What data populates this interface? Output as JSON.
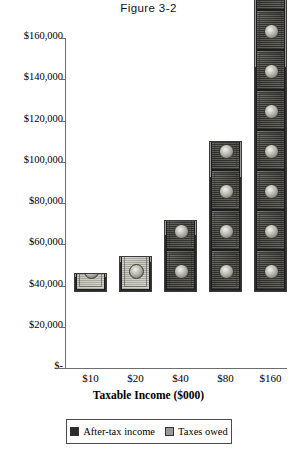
{
  "figure": {
    "title": "Figure 3-2"
  },
  "chart_data": {
    "type": "bar",
    "title": "Figure 3-2",
    "xlabel": "Taxable Income ($000)",
    "ylabel": "",
    "categories": [
      "$10",
      "$20",
      "$40",
      "$80",
      "$160"
    ],
    "ylim": [
      0,
      160000
    ],
    "ytick_labels": [
      "$160,000",
      "$140,000",
      "$120,000",
      "$100,000",
      "$80,000",
      "$60,000",
      "$40,000",
      "$20,000",
      "$-"
    ],
    "ytick_values": [
      160000,
      140000,
      120000,
      100000,
      80000,
      60000,
      40000,
      20000,
      0
    ],
    "grid": false,
    "stacked": true,
    "legend_position": "bottom",
    "series": [
      {
        "name": "After-tax income",
        "color": "#2b2b2b",
        "values": [
          8850,
          17340,
          32120,
          61840,
          118560
        ]
      },
      {
        "name": "Taxes owed",
        "color": "#9a9a9a",
        "values": [
          1150,
          2660,
          7880,
          18160,
          41440
        ]
      }
    ],
    "totals": [
      10000,
      20000,
      40000,
      80000,
      160000
    ],
    "bar_totals_plotted": [
      9000,
      17500,
      35000,
      73000,
      148000
    ],
    "annotations": [
      "11.5%",
      "13.3%",
      "19.7%",
      "22.7%",
      "25.9%"
    ],
    "annotation_meaning": "effective tax rate (taxes owed as percent of taxable income)"
  },
  "legend": {
    "entries": [
      {
        "label": "After-tax income",
        "color": "#2b2b2b"
      },
      {
        "label": "Taxes owed",
        "color": "#9a9a9a"
      }
    ]
  }
}
